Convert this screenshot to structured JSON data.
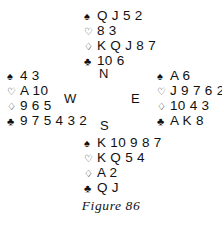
{
  "figure": {
    "caption": "Figure 86",
    "type": "bridge-deal-diagram"
  },
  "suits": {
    "spade_symbol": "♠",
    "heart_symbol": "♡",
    "diamond_symbol": "♢",
    "club_symbol": "♣",
    "spade_name": "spades",
    "heart_name": "hearts",
    "diamond_name": "diamonds",
    "club_name": "clubs",
    "color": "#111111"
  },
  "compass": {
    "north": "N",
    "west": "W",
    "east": "E",
    "south": "S"
  },
  "hands": {
    "north": {
      "label": "North",
      "spades": "Q J 5 2",
      "hearts": "8 3",
      "diamonds": "K Q J 8 7",
      "clubs": "10 6"
    },
    "west": {
      "label": "West",
      "spades": "4 3",
      "hearts": "A 10",
      "diamonds": "9 6 5",
      "clubs": "9 7 5 4 3 2"
    },
    "east": {
      "label": "East",
      "spades": "A 6",
      "hearts": "J 9 7 6 2",
      "diamonds": "10 4 3",
      "clubs": "A K 8"
    },
    "south": {
      "label": "South",
      "spades": "K 10 9 8 7",
      "hearts": "K Q 5 4",
      "diamonds": "A 2",
      "clubs": "Q J"
    }
  }
}
